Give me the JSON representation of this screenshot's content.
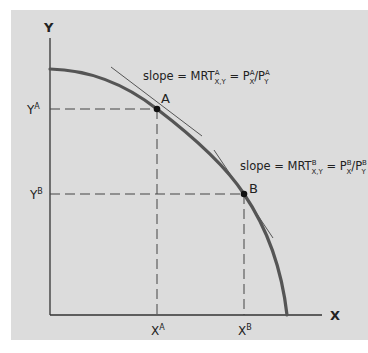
{
  "diagram": {
    "type": "production-possibilities-frontier",
    "colors": {
      "panel_background": "#dcdcdc",
      "axis": "#333333",
      "curve": "#555555",
      "tangent": "#555555",
      "guide_dashed": "#444444",
      "point": "#111111",
      "text": "#222222"
    },
    "axes": {
      "x_label": "X",
      "y_label": "Y"
    },
    "ticks": {
      "x": [
        {
          "base": "X",
          "sup": "A"
        },
        {
          "base": "X",
          "sup": "B"
        }
      ],
      "y": [
        {
          "base": "Y",
          "sup": "A"
        },
        {
          "base": "Y",
          "sup": "B"
        }
      ]
    },
    "points": [
      {
        "label": "A"
      },
      {
        "label": "B"
      }
    ],
    "annotations": [
      {
        "prefix": "slope = MRT",
        "mrt_sup": "A",
        "mrt_sub": "X,Y",
        "eq": " = P",
        "px_sup": "A",
        "px_sub": "X",
        "slash": "/P",
        "py_sup": "A",
        "py_sub": "Y"
      },
      {
        "prefix": "slope = MRT",
        "mrt_sup": "B",
        "mrt_sub": "X,Y",
        "eq": " = P",
        "px_sup": "B",
        "px_sub": "X",
        "slash": "/P",
        "py_sup": "B",
        "py_sub": "Y"
      }
    ]
  }
}
